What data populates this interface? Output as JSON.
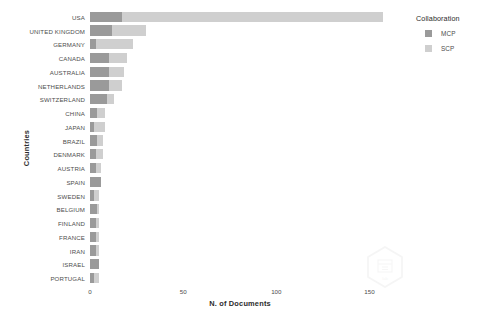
{
  "chart_data": {
    "type": "bar",
    "orientation": "horizontal",
    "stacked": true,
    "title": "",
    "xlabel": "N. of Documents",
    "ylabel": "Countries",
    "xlim": [
      0,
      161
    ],
    "xticks": [
      0,
      50,
      100,
      150
    ],
    "grid": false,
    "legend_position": "right",
    "legend_title": "Collaboration",
    "categories": [
      "USA",
      "UNITED KINGDOM",
      "GERMANY",
      "CANADA",
      "AUSTRALIA",
      "NETHERLANDS",
      "SWITZERLAND",
      "CHINA",
      "JAPAN",
      "BRAZIL",
      "DENMARK",
      "AUSTRIA",
      "SPAIN",
      "SWEDEN",
      "BELGIUM",
      "FINLAND",
      "FRANCE",
      "IRAN",
      "ISRAEL",
      "PORTUGAL"
    ],
    "series": [
      {
        "name": "MCP",
        "color": "#9a9a9a",
        "values": [
          17,
          12,
          3,
          10,
          10,
          10,
          9,
          4,
          2,
          4,
          3,
          3,
          6,
          2,
          4,
          3,
          3,
          3,
          5,
          2
        ]
      },
      {
        "name": "SCP",
        "color": "#cfcfcf",
        "values": [
          140,
          18,
          20,
          10,
          8,
          7,
          4,
          4,
          6,
          3,
          4,
          3,
          0,
          3,
          1,
          2,
          2,
          2,
          0,
          3
        ]
      }
    ],
    "totals": [
      157,
      30,
      23,
      20,
      18,
      17,
      13,
      8,
      8,
      7,
      7,
      6,
      6,
      5,
      5,
      5,
      5,
      5,
      5,
      5
    ]
  },
  "legend": {
    "title": "Collaboration",
    "items": [
      {
        "label": "MCP",
        "color": "#9a9a9a"
      },
      {
        "label": "SCP",
        "color": "#cfcfcf"
      }
    ]
  },
  "axes": {
    "x_title": "N. of Documents",
    "y_title": "Countries",
    "x_tick_labels": [
      "0",
      "50",
      "100",
      "150"
    ]
  }
}
